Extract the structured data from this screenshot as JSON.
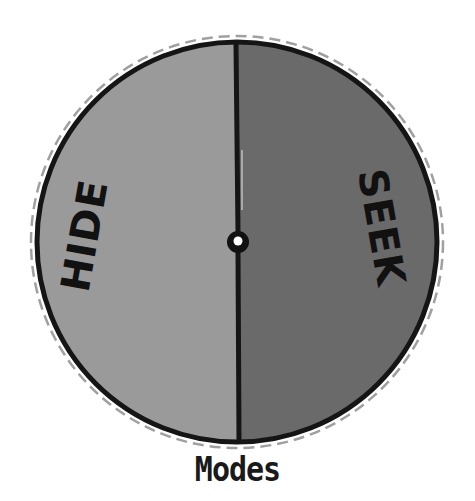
{
  "diagram": {
    "type": "spinner-wheel",
    "segments": [
      {
        "label": "HIDE",
        "color": "#9a9a9a",
        "side": "left"
      },
      {
        "label": "SEEK",
        "color": "#6a6a6a",
        "side": "right"
      }
    ],
    "outline_color": "#151515",
    "cut_line_color": "#a0a0a0",
    "hub_color": "#111111",
    "hub_hole_color": "#ffffff"
  },
  "caption": "Modes"
}
